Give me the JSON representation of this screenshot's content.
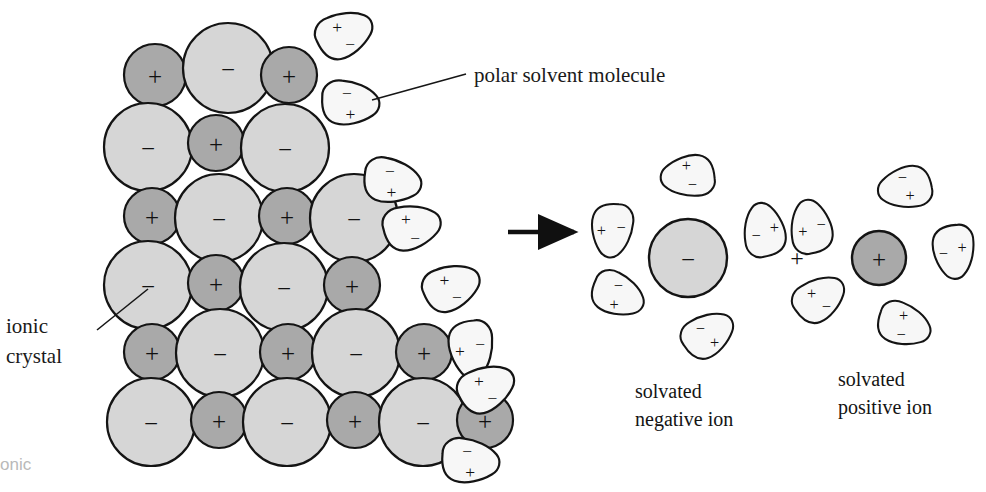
{
  "figure": {
    "colors": {
      "cation_fill": "#a9a9a9",
      "anion_fill": "#d6d6d6",
      "solvent_fill": "#f7f7f7",
      "outline": "#141414",
      "text": "#141414",
      "watermark": "#b9b9b9",
      "background": "#ffffff"
    }
  },
  "labels": {
    "polar_solvent": "polar solvent molecule",
    "ionic_crystal_line1": "ionic",
    "ionic_crystal_line2": "crystal",
    "solvated_negative_line1": "solvated",
    "solvated_negative_line2": "negative ion",
    "solvated_positive_line1": "solvated",
    "solvated_positive_line2": "positive ion",
    "plus_separator": "+",
    "watermark": "onic"
  },
  "glyphs": {
    "positive": "+",
    "negative": "−"
  },
  "crystal": {
    "description": "Alternating lattice of large negative ions and small positive ions",
    "ions": [
      {
        "cx": 155,
        "cy": 75,
        "r": 31,
        "charge": "+",
        "type": "cation"
      },
      {
        "cx": 228,
        "cy": 68,
        "r": 45,
        "charge": "−",
        "type": "anion"
      },
      {
        "cx": 289,
        "cy": 75,
        "r": 28,
        "charge": "+",
        "type": "cation"
      },
      {
        "cx": 148,
        "cy": 147,
        "r": 44,
        "charge": "−",
        "type": "anion"
      },
      {
        "cx": 216,
        "cy": 143,
        "r": 28,
        "charge": "+",
        "type": "cation"
      },
      {
        "cx": 285,
        "cy": 148,
        "r": 44,
        "charge": "−",
        "type": "anion"
      },
      {
        "cx": 152,
        "cy": 216,
        "r": 28,
        "charge": "+",
        "type": "cation"
      },
      {
        "cx": 219,
        "cy": 218,
        "r": 44,
        "charge": "−",
        "type": "anion"
      },
      {
        "cx": 287,
        "cy": 216,
        "r": 28,
        "charge": "+",
        "type": "cation"
      },
      {
        "cx": 354,
        "cy": 218,
        "r": 44,
        "charge": "−",
        "type": "anion"
      },
      {
        "cx": 148,
        "cy": 285,
        "r": 44,
        "charge": "−",
        "type": "anion"
      },
      {
        "cx": 216,
        "cy": 283,
        "r": 28,
        "charge": "+",
        "type": "cation"
      },
      {
        "cx": 284,
        "cy": 287,
        "r": 44,
        "charge": "−",
        "type": "anion"
      },
      {
        "cx": 352,
        "cy": 285,
        "r": 28,
        "charge": "+",
        "type": "cation"
      },
      {
        "cx": 152,
        "cy": 352,
        "r": 28,
        "charge": "+",
        "type": "cation"
      },
      {
        "cx": 220,
        "cy": 353,
        "r": 44,
        "charge": "−",
        "type": "anion"
      },
      {
        "cx": 288,
        "cy": 352,
        "r": 28,
        "charge": "+",
        "type": "cation"
      },
      {
        "cx": 356,
        "cy": 353,
        "r": 44,
        "charge": "−",
        "type": "anion"
      },
      {
        "cx": 424,
        "cy": 352,
        "r": 28,
        "charge": "+",
        "type": "cation"
      },
      {
        "cx": 151,
        "cy": 422,
        "r": 44,
        "charge": "−",
        "type": "anion"
      },
      {
        "cx": 219,
        "cy": 420,
        "r": 28,
        "charge": "+",
        "type": "cation"
      },
      {
        "cx": 287,
        "cy": 422,
        "r": 44,
        "charge": "−",
        "type": "anion"
      },
      {
        "cx": 355,
        "cy": 420,
        "r": 28,
        "charge": "+",
        "type": "cation"
      },
      {
        "cx": 423,
        "cy": 422,
        "r": 44,
        "charge": "−",
        "type": "anion"
      },
      {
        "cx": 485,
        "cy": 420,
        "r": 28,
        "charge": "+",
        "type": "cation"
      }
    ]
  },
  "free_solvent_molecules": [
    {
      "cx": 345,
      "cy": 35,
      "rot": -20,
      "top": "+",
      "bottom": "−"
    },
    {
      "cx": 350,
      "cy": 104,
      "rot": 8,
      "top": "−",
      "bottom": "+"
    },
    {
      "cx": 392,
      "cy": 182,
      "rot": 14,
      "top": "−",
      "bottom": "+"
    },
    {
      "cx": 412,
      "cy": 228,
      "rot": -8,
      "top": "+",
      "bottom": "−"
    },
    {
      "cx": 452,
      "cy": 288,
      "rot": -18,
      "top": "+",
      "bottom": "−"
    },
    {
      "cx": 470,
      "cy": 349,
      "rot": 90,
      "top": "−",
      "bottom": "+"
    },
    {
      "cx": 487,
      "cy": 389,
      "rot": -22,
      "top": "+",
      "bottom": "−"
    },
    {
      "cx": 470,
      "cy": 462,
      "rot": 10,
      "top": "−",
      "bottom": "+"
    }
  ],
  "solvated_negative_ion": {
    "center": {
      "cx": 688,
      "cy": 258,
      "r": 39,
      "charge": "−"
    },
    "shell": [
      {
        "angle": 208,
        "dist": 80,
        "rot": 30,
        "outer": "−",
        "inner": "+"
      },
      {
        "angle": 285,
        "dist": 80,
        "rot": -28,
        "outer": "−",
        "inner": "+"
      },
      {
        "angle": 160,
        "dist": 82,
        "rot": 100,
        "outer": "−",
        "inner": "+"
      },
      {
        "angle": 20,
        "dist": 82,
        "rot": -95,
        "outer": "−",
        "inner": "+"
      },
      {
        "angle": 90,
        "dist": 83,
        "rot": 180,
        "outer": "−",
        "inner": "+"
      }
    ]
  },
  "solvated_positive_ion": {
    "center": {
      "cx": 879,
      "cy": 258,
      "r": 27,
      "charge": "+"
    },
    "shell": [
      {
        "angle": 215,
        "dist": 72,
        "rot": -30,
        "outer": "+",
        "inner": "−"
      },
      {
        "angle": 290,
        "dist": 72,
        "rot": 25,
        "outer": "+",
        "inner": "−"
      },
      {
        "angle": 155,
        "dist": 74,
        "rot": -95,
        "outer": "+",
        "inner": "−"
      },
      {
        "angle": 5,
        "dist": 74,
        "rot": 90,
        "outer": "+",
        "inner": "−"
      },
      {
        "angle": 70,
        "dist": 76,
        "rot": 175,
        "outer": "+",
        "inner": "−"
      }
    ]
  },
  "arrow": {
    "x1": 508,
    "y1": 232,
    "x2": 582,
    "y2": 232
  },
  "leaders": {
    "polar_solvent": {
      "x1": 372,
      "y1": 100,
      "x2": 466,
      "y2": 74
    },
    "ionic_crystal": {
      "x1": 97,
      "y1": 330,
      "x2": 148,
      "y2": 289
    }
  },
  "text_positions": {
    "polar_solvent": {
      "x": 474,
      "y": 82
    },
    "ionic_crystal": {
      "x": 6,
      "y": 333
    },
    "solvated_negative": {
      "x": 635,
      "y": 398
    },
    "solvated_positive": {
      "x": 838,
      "y": 386
    },
    "plus_separator": {
      "x": 797,
      "y": 258
    },
    "watermark": {
      "x": 0,
      "y": 470
    }
  }
}
